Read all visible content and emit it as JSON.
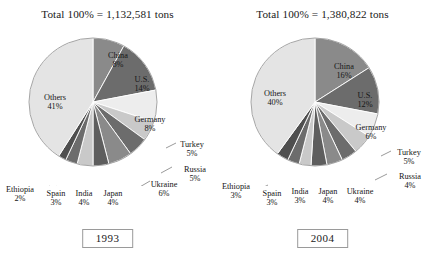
{
  "charts": [
    {
      "id": "1993",
      "title": "Total 100% = 1,132,581 tons",
      "year_label": "1993",
      "slices": [
        {
          "name": "China",
          "pct": 8,
          "pct_label": "8%",
          "color": "#8a8a8a"
        },
        {
          "name": "U.S.",
          "pct": 14,
          "pct_label": "14%",
          "color": "#6c6c6c"
        },
        {
          "name": "Germany",
          "pct": 8,
          "pct_label": "8%",
          "color": "#ededed"
        },
        {
          "name": "Turkey",
          "pct": 5,
          "pct_label": "5%",
          "color": "#c9c9c9"
        },
        {
          "name": "Russia",
          "pct": 5,
          "pct_label": "5%",
          "color": "#6c6c6c"
        },
        {
          "name": "Ukraine",
          "pct": 6,
          "pct_label": "6%",
          "color": "#8a8a8a"
        },
        {
          "name": "Japan",
          "pct": 4,
          "pct_label": "4%",
          "color": "#5e5e5e"
        },
        {
          "name": "India",
          "pct": 4,
          "pct_label": "4%",
          "color": "#c9c9c9"
        },
        {
          "name": "Spain",
          "pct": 3,
          "pct_label": "3%",
          "color": "#6c6c6c"
        },
        {
          "name": "Ethiopia",
          "pct": 2,
          "pct_label": "2%",
          "color": "#4f4f4f"
        },
        {
          "name": "Others",
          "pct": 41,
          "pct_label": "41%",
          "color": "#e4e4e4"
        }
      ]
    },
    {
      "id": "2004",
      "title": "Total 100% = 1,380,822 tons",
      "year_label": "2004",
      "slices": [
        {
          "name": "China",
          "pct": 16,
          "pct_label": "16%",
          "color": "#8a8a8a"
        },
        {
          "name": "U.S.",
          "pct": 12,
          "pct_label": "12%",
          "color": "#6c6c6c"
        },
        {
          "name": "Germany",
          "pct": 6,
          "pct_label": "6%",
          "color": "#ededed"
        },
        {
          "name": "Turkey",
          "pct": 5,
          "pct_label": "5%",
          "color": "#c9c9c9"
        },
        {
          "name": "Russia",
          "pct": 4,
          "pct_label": "4%",
          "color": "#6c6c6c"
        },
        {
          "name": "Ukraine",
          "pct": 4,
          "pct_label": "4%",
          "color": "#8a8a8a"
        },
        {
          "name": "Japan",
          "pct": 4,
          "pct_label": "4%",
          "color": "#5e5e5e"
        },
        {
          "name": "India",
          "pct": 3,
          "pct_label": "3%",
          "color": "#c9c9c9"
        },
        {
          "name": "Spain",
          "pct": 3,
          "pct_label": "3%",
          "color": "#6c6c6c"
        },
        {
          "name": "Ethiopia",
          "pct": 3,
          "pct_label": "3%",
          "color": "#4f4f4f"
        },
        {
          "name": "Others",
          "pct": 40,
          "pct_label": "40%",
          "color": "#e4e4e4"
        }
      ]
    }
  ],
  "chart_data": [
    {
      "type": "pie",
      "title": "Total 100% = 1,132,581 tons",
      "annotations": [
        "1993"
      ],
      "total_label": "Total 100% = 1,132,581 tons",
      "total_value": 1132581,
      "total_units": "tons",
      "categories": [
        "China",
        "U.S.",
        "Germany",
        "Turkey",
        "Russia",
        "Ukraine",
        "Japan",
        "India",
        "Spain",
        "Ethiopia",
        "Others"
      ],
      "values": [
        8,
        14,
        8,
        5,
        5,
        6,
        4,
        4,
        3,
        2,
        41
      ],
      "value_unit": "percent",
      "start_angle_deg": 0,
      "direction": "clockwise",
      "legend": "none",
      "grid": false,
      "xlabel": "",
      "ylabel": ""
    },
    {
      "type": "pie",
      "title": "Total 100% = 1,380,822 tons",
      "annotations": [
        "2004"
      ],
      "total_label": "Total 100% = 1,380,822 tons",
      "total_value": 1380822,
      "total_units": "tons",
      "categories": [
        "China",
        "U.S.",
        "Germany",
        "Turkey",
        "Russia",
        "Ukraine",
        "Japan",
        "India",
        "Spain",
        "Ethiopia",
        "Others"
      ],
      "values": [
        16,
        12,
        6,
        5,
        4,
        4,
        4,
        3,
        3,
        3,
        40
      ],
      "value_unit": "percent",
      "start_angle_deg": 0,
      "direction": "clockwise",
      "legend": "none",
      "grid": false,
      "xlabel": "",
      "ylabel": ""
    }
  ]
}
